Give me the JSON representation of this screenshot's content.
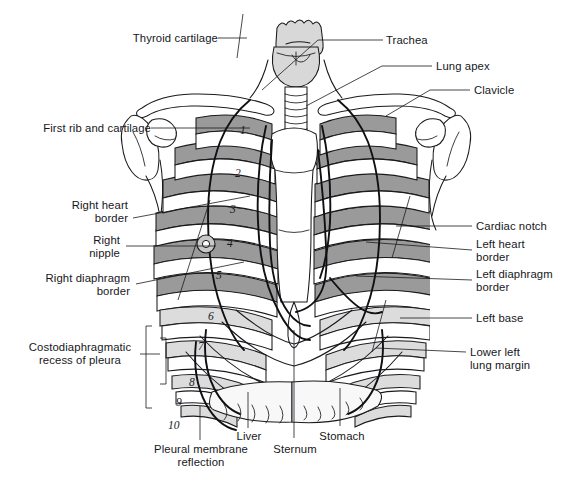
{
  "figure": {
    "type": "anatomical-diagram",
    "background_color": "#ffffff",
    "line_color": "#1a1a1e",
    "text_color": "#17171b",
    "shade_colors": {
      "rib_posterior": "#9a9a9a",
      "rib_anterior": "#ffffff",
      "cartilage": "#d8d8d8",
      "lung_light": "#efefef",
      "lung_mid": "#dcdcdc",
      "organ_light": "#f6f6f6"
    }
  },
  "labels": {
    "left": [
      {
        "id": "thyroid-cartilage",
        "text": "Thyroid cartilage"
      },
      {
        "id": "first-rib-and-cartilage",
        "text": "First rib and cartilage"
      },
      {
        "id": "right-heart-border",
        "text": "Right heart\nborder"
      },
      {
        "id": "right-nipple",
        "text": "Right\nnipple"
      },
      {
        "id": "right-diaphragm-border",
        "text": "Right diaphragm\nborder"
      },
      {
        "id": "costodiaphragmatic-recess",
        "text": "Costodiaphragmatic\nrecess of pleura"
      }
    ],
    "right": [
      {
        "id": "trachea",
        "text": "Trachea"
      },
      {
        "id": "lung-apex",
        "text": "Lung apex"
      },
      {
        "id": "clavicle",
        "text": "Clavicle"
      },
      {
        "id": "cardiac-notch",
        "text": "Cardiac notch"
      },
      {
        "id": "left-heart-border",
        "text": "Left heart\nborder"
      },
      {
        "id": "left-diaphragm-border",
        "text": "Left diaphragm\nborder"
      },
      {
        "id": "left-base",
        "text": "Left base"
      },
      {
        "id": "lower-left-lung-margin",
        "text": "Lower left\nlung margin"
      }
    ],
    "bottom": [
      {
        "id": "pleural-membrane-reflection",
        "text": "Pleural membrane\nreflection"
      },
      {
        "id": "liver",
        "text": "Liver"
      },
      {
        "id": "sternum",
        "text": "Sternum"
      },
      {
        "id": "stomach",
        "text": "Stomach"
      }
    ]
  },
  "rib_numbers": [
    "1",
    "2",
    "3",
    "4",
    "5",
    "6",
    "7",
    "8",
    "9",
    "10"
  ]
}
